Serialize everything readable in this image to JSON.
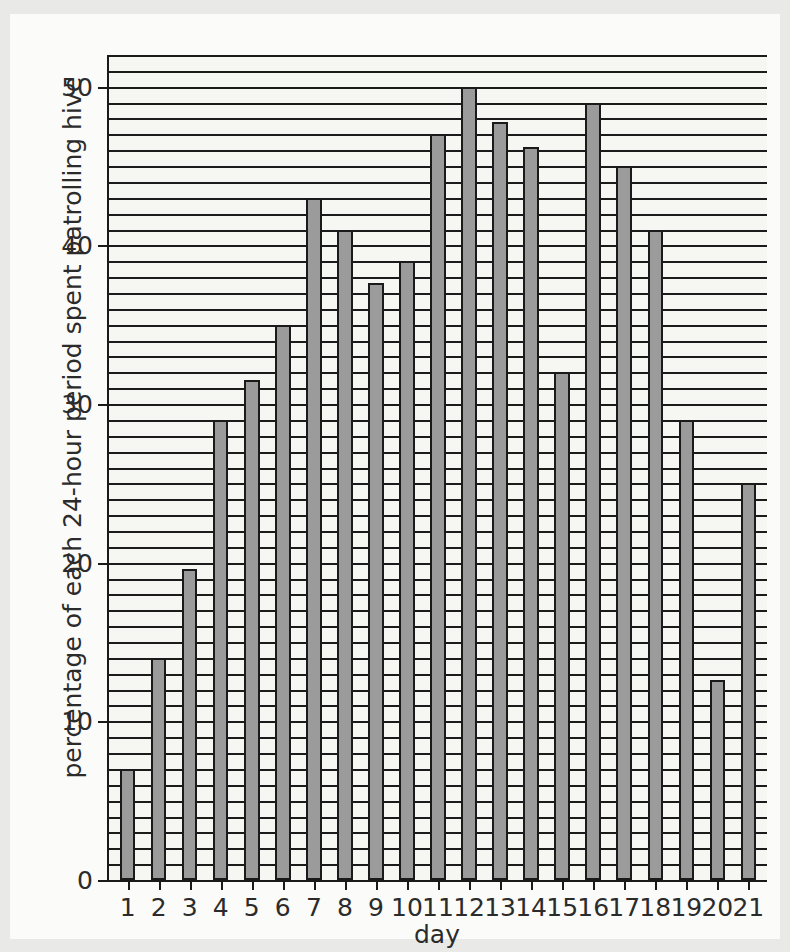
{
  "chart_data": {
    "type": "bar",
    "title": "",
    "subtitle": "",
    "xlabel": "day",
    "ylabel": "percentage of each 24-hour period spent patrolling hive",
    "categories": [
      "1",
      "2",
      "3",
      "4",
      "5",
      "6",
      "7",
      "8",
      "9",
      "10",
      "11",
      "12",
      "13",
      "14",
      "15",
      "16",
      "17",
      "18",
      "19",
      "20",
      "21"
    ],
    "values": [
      7,
      14,
      19.6,
      29,
      31.5,
      35,
      43,
      41,
      37.6,
      39,
      47,
      50,
      47.8,
      46.2,
      32,
      49,
      45,
      41,
      29,
      12.6,
      25
    ],
    "series": [
      {
        "name": "percentage of each 24-hour period spent patrolling hive",
        "values": [
          7,
          14,
          19.6,
          29,
          31.5,
          35,
          43,
          41,
          37.6,
          39,
          47,
          50,
          47.8,
          46.2,
          32,
          49,
          45,
          41,
          29,
          12.6,
          25
        ]
      }
    ],
    "ylim": [
      0,
      52
    ],
    "xlim": [
      0.4,
      21.6
    ],
    "y_major_ticks": [
      0,
      10,
      20,
      30,
      40,
      50
    ],
    "y_major_tick_labels": [
      "0",
      "10",
      "20",
      "30",
      "40",
      "50"
    ],
    "y_gridline_interval": 1,
    "grid": true,
    "grid_axis": "y",
    "legend": false,
    "legend_position": "none",
    "bar_fill_color": "#9b9b9b",
    "bar_edge_color": "#1a1a1a",
    "plot_background_color": "#f6f6f2",
    "figure_background_color": "#e9e9e7",
    "axis_color": "#1a1a1a",
    "text_color": "#2b2b2b"
  }
}
